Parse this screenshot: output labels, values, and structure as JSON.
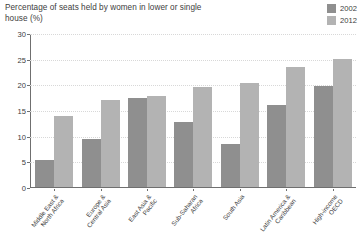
{
  "chart_data": {
    "type": "bar",
    "title": "Percentage of seats held by women in lower or single house (%)",
    "xlabel": "",
    "ylabel": "",
    "ylim": [
      0,
      30
    ],
    "yticks": [
      0,
      5,
      10,
      15,
      20,
      25,
      30
    ],
    "grid": true,
    "legend_position": "top-right",
    "categories": [
      "Middle East &\nNorth Africa",
      "Europe &\nCentral Asia",
      "East Asia &\nPacific",
      "Sub-Saharan\nAfrica",
      "South Asia",
      "Latin America &\nCaribbean",
      "High-income\nOECD"
    ],
    "series": [
      {
        "name": "2002",
        "color": "#8f8f8f",
        "values": [
          5.2,
          9.3,
          17.4,
          12.7,
          8.3,
          16.0,
          19.7
        ]
      },
      {
        "name": "2012",
        "color": "#b3b3b3",
        "values": [
          13.9,
          17.0,
          17.8,
          19.5,
          20.3,
          23.4,
          25.0
        ]
      }
    ]
  },
  "axis": {
    "tick_labels": [
      "0",
      "5",
      "10",
      "15",
      "20",
      "25",
      "30"
    ]
  },
  "colors": {
    "series_2002": "#8f8f8f",
    "series_2012": "#b3b3b3",
    "axis": "#6f6f6f",
    "gridline": "#d8d8d8",
    "text": "#3d3d3d",
    "background": "#ffffff"
  }
}
